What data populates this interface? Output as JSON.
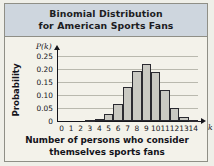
{
  "figure": {
    "title_line1": "Binomial Distribution",
    "title_line2": "for American Sports Fans",
    "band_color": "#ced6de",
    "bar_fill": "#c9c9c2",
    "bar_stroke": "#2a2a30",
    "grid_color": "#b9b9ae",
    "axis_color": "#15151b",
    "background": "#f3f2ea"
  },
  "chart_data": {
    "type": "bar",
    "title": "Binomial Distribution for American Sports Fans",
    "xlabel": "Number of persons who consider themselves sports fans",
    "ylabel": "Probability",
    "x_axis_symbol": "k",
    "y_axis_symbol": "P(k)",
    "categories": [
      "0",
      "1",
      "2",
      "3",
      "4",
      "5",
      "6",
      "7",
      "8",
      "9",
      "10",
      "11",
      "12",
      "13",
      "14"
    ],
    "values": [
      0.0,
      0.0,
      0.001,
      0.002,
      0.007,
      0.027,
      0.065,
      0.131,
      0.194,
      0.22,
      0.189,
      0.119,
      0.051,
      0.015,
      0.002
    ],
    "ylim": [
      0,
      0.27
    ],
    "xlim": [
      0,
      14
    ],
    "yticks": [
      0,
      0.05,
      0.1,
      0.15,
      0.2,
      0.25
    ],
    "ytick_labels": [
      "0",
      "0.05",
      "0.10",
      "0.15",
      "0.20",
      "0.25"
    ],
    "grid": true,
    "grid_axis": "y",
    "legend": false,
    "legend_position": "none"
  }
}
